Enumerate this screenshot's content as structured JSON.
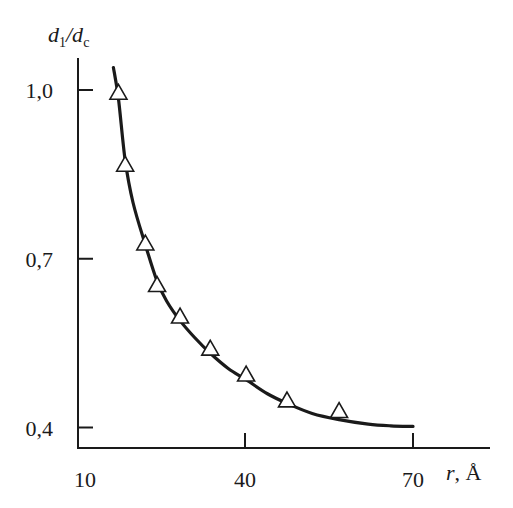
{
  "chart_data": {
    "type": "line",
    "title": "",
    "xlabel": "r, Å",
    "ylabel": "d1/dc",
    "xlim": [
      10,
      75
    ],
    "ylim": [
      0.37,
      1.06
    ],
    "x_ticks": [
      10,
      40,
      70
    ],
    "x_tick_labels": [
      "10",
      "40",
      "70"
    ],
    "y_ticks": [
      0.4,
      0.7,
      1.0
    ],
    "y_tick_labels": [
      "0,4",
      "0,7",
      "1,0"
    ],
    "grid": false,
    "legend": null,
    "series": [
      {
        "name": "experimental points",
        "style": "open-triangle-markers",
        "x": [
          17.4,
          18.6,
          22.2,
          24.3,
          28.4,
          33.8,
          40.2,
          47.5,
          56.8
        ],
        "y": [
          0.995,
          0.867,
          0.727,
          0.653,
          0.597,
          0.54,
          0.494,
          0.448,
          0.429
        ]
      },
      {
        "name": "fitted curve",
        "style": "solid-line",
        "x": [
          16.5,
          17.4,
          18.6,
          20,
          22.2,
          24.3,
          26,
          28.4,
          31,
          33.8,
          37,
          40.2,
          44,
          47.5,
          52,
          56.8,
          62,
          66,
          70
        ],
        "y": [
          1.04,
          0.985,
          0.875,
          0.8,
          0.725,
          0.66,
          0.625,
          0.59,
          0.56,
          0.532,
          0.505,
          0.485,
          0.46,
          0.443,
          0.425,
          0.414,
          0.406,
          0.403,
          0.402
        ]
      }
    ]
  },
  "axes": {
    "y_label_main": "d",
    "y_label_sub1": "1",
    "y_label_slash": "/d",
    "y_label_sub2": "c",
    "x_label_var": "r",
    "x_label_unit": ", Å"
  }
}
